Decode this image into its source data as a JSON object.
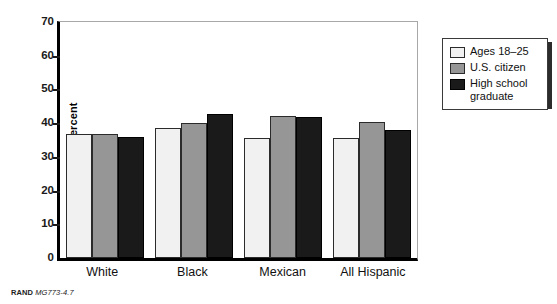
{
  "chart_data": {
    "type": "bar",
    "title": "",
    "xlabel": "",
    "ylabel": "Percent",
    "ylim": [
      0,
      70
    ],
    "yticks": [
      0,
      10,
      20,
      30,
      40,
      50,
      60,
      70
    ],
    "grid": false,
    "legend_position": "right-outside",
    "categories": [
      "White",
      "Black",
      "Mexican",
      "All Hispanic"
    ],
    "series": [
      {
        "name": "Ages 18–25",
        "color": "#f1f1f1",
        "values": [
          36.8,
          38.5,
          35.5,
          35.5
        ]
      },
      {
        "name": "U.S. citizen",
        "color": "#969696",
        "values": [
          36.8,
          40.0,
          42.2,
          40.4
        ]
      },
      {
        "name": "High school graduate",
        "color": "#1a1a1a",
        "values": [
          35.8,
          42.8,
          41.7,
          37.9
        ]
      }
    ]
  },
  "axis": {
    "y_label": "Percent",
    "y_ticks": [
      "70",
      "60",
      "50",
      "40",
      "30",
      "20",
      "10",
      "0"
    ]
  },
  "legend": {
    "items": [
      {
        "label": "Ages 18–25"
      },
      {
        "label": "U.S. citizen"
      },
      {
        "label": "High school\ngraduate"
      }
    ]
  },
  "source_note": {
    "organization": "RAND",
    "reference": "MG773-4.7"
  }
}
